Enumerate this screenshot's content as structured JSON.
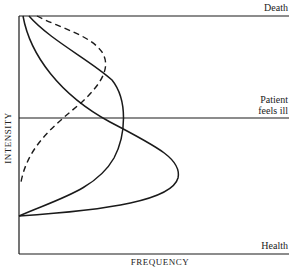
{
  "diagram": {
    "type": "intensity-vs-frequency distribution curves",
    "axes": {
      "x_label": "FREQUENCY",
      "y_label": "INTENSITY"
    },
    "levels": {
      "top": "Death",
      "middle_line1": "Patient",
      "middle_line2": "feels ill",
      "bottom": "Health"
    },
    "curves": [
      {
        "name": "curve-wide-solid",
        "style": "solid",
        "description": "largest bulge below 'Patient feels ill' line"
      },
      {
        "name": "curve-mid-solid",
        "style": "solid",
        "description": "bulge near 'Patient feels ill' line"
      },
      {
        "name": "curve-dashed",
        "style": "dashed",
        "description": "bulge above 'Patient feels ill' line"
      }
    ],
    "colors": {
      "ink": "#1a1a1a",
      "background": "#ffffff"
    }
  }
}
